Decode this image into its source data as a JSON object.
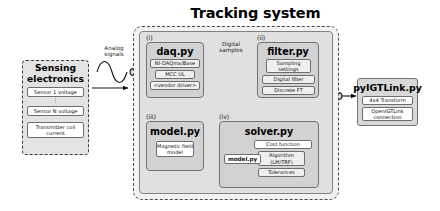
{
  "diagram": {
    "title": "Tracking system",
    "sensing": {
      "title_line1": "Sensing",
      "title_line2": "electronics",
      "items": [
        "Sensor 1 voltage",
        "Sensor N voltage",
        "Transmitter coil current"
      ],
      "ellipsis": "⋮"
    },
    "wires": {
      "analog": "Analog\nsignals",
      "analog_line1": "Analog",
      "analog_line2": "signals",
      "digital_line1": "Digital",
      "digital_line2": "samples"
    },
    "modules": [
      {
        "index": "(i)",
        "name": "daq.py",
        "items": [
          "NI-DAQmx/Base",
          "MCC UL",
          "<vendor driver>"
        ]
      },
      {
        "index": "(ii)",
        "name": "filter.py",
        "items": [
          "Sampling settings",
          "Digital filter",
          "Discrete FT"
        ]
      },
      {
        "index": "(iii)",
        "name": "model.py",
        "items": [
          "Magnetic field model"
        ]
      },
      {
        "index": "(iv)",
        "name": "solver.py",
        "items": [
          "Cost function",
          "Algorithm (LM/TRF)",
          "Tolerances"
        ],
        "embedded": "model.py"
      }
    ],
    "output": {
      "name": "pyIGTLink.py",
      "items": [
        "4x4 Transform",
        "OpenIGTLink connection"
      ]
    },
    "colors": {
      "background": "#ffffff",
      "panel": "#e0e0e0",
      "module": "#d2d2d2",
      "chip": "#efefef",
      "border": "#737373",
      "dashed_border": "#4a4a4a",
      "text": "#000000"
    }
  }
}
